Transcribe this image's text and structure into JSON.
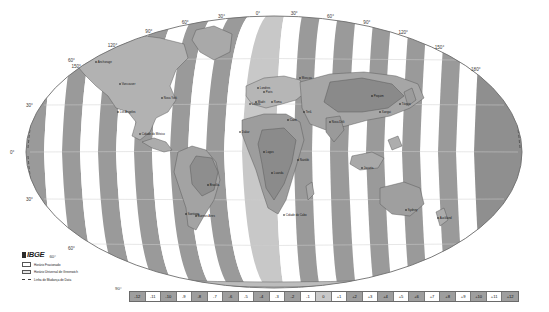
{
  "map": {
    "title": "Fusos Horários",
    "projection": "oval / Mollweide-like world projection",
    "source_org": "IBGE",
    "longitude_labels": [
      "150°",
      "120°",
      "90°",
      "60°",
      "30°",
      "0°",
      "30°",
      "60°",
      "90°",
      "120°",
      "150°",
      "180°"
    ],
    "latitude_labels_left": [
      "60°",
      "30°",
      "0°",
      "30°",
      "60°"
    ],
    "latitude_label_bottom": "90°",
    "band_colors": {
      "dark": "#9a9a9a",
      "light": "#ffffff",
      "mid": "#c8c8c8",
      "ocean": "#ffffff",
      "land_fill": "#b4b4b4",
      "land_dark": "#8d8d8d",
      "graticule": "#cfcfcf",
      "outline": "#4a4a4a"
    },
    "cities": [
      {
        "name": "Anchorage",
        "x": 96,
        "y": 62
      },
      {
        "name": "Vancouver",
        "x": 120,
        "y": 84
      },
      {
        "name": "Los Angeles",
        "x": 118,
        "y": 112
      },
      {
        "name": "Cidade do México",
        "x": 140,
        "y": 134
      },
      {
        "name": "Nova York",
        "x": 162,
        "y": 98
      },
      {
        "name": "Brasília",
        "x": 208,
        "y": 185
      },
      {
        "name": "Buenos Aires",
        "x": 196,
        "y": 216
      },
      {
        "name": "Santiago",
        "x": 186,
        "y": 214
      },
      {
        "name": "Lisboa",
        "x": 250,
        "y": 104
      },
      {
        "name": "Londres",
        "x": 258,
        "y": 88
      },
      {
        "name": "Paris",
        "x": 264,
        "y": 92
      },
      {
        "name": "Madri",
        "x": 256,
        "y": 102
      },
      {
        "name": "Roma",
        "x": 272,
        "y": 102
      },
      {
        "name": "Dakar",
        "x": 240,
        "y": 132
      },
      {
        "name": "Lagos",
        "x": 264,
        "y": 152
      },
      {
        "name": "Luanda",
        "x": 272,
        "y": 173
      },
      {
        "name": "Cidade do Cabo",
        "x": 284,
        "y": 215
      },
      {
        "name": "Cairo",
        "x": 288,
        "y": 120
      },
      {
        "name": "Nairóbi",
        "x": 298,
        "y": 160
      },
      {
        "name": "Moscou",
        "x": 300,
        "y": 78
      },
      {
        "name": "Terã",
        "x": 304,
        "y": 112
      },
      {
        "name": "Nova Déli",
        "x": 330,
        "y": 122
      },
      {
        "name": "Pequim",
        "x": 372,
        "y": 96
      },
      {
        "name": "Tóquio",
        "x": 400,
        "y": 104
      },
      {
        "name": "Xangai",
        "x": 380,
        "y": 112
      },
      {
        "name": "Jacarta",
        "x": 362,
        "y": 168
      },
      {
        "name": "Sydney",
        "x": 406,
        "y": 210
      },
      {
        "name": "Auckland",
        "x": 438,
        "y": 218
      }
    ]
  },
  "legend": {
    "org_name": "IBGE",
    "latitude_marker": "60°",
    "items": [
      {
        "swatch": "white-box",
        "label": "Horário Fracionado"
      },
      {
        "swatch": "gray-box",
        "label": "Horário Universal de Greenwich"
      },
      {
        "swatch": "dashed-line",
        "label": "Linha de Mudança de Data"
      }
    ]
  },
  "zone_scale": {
    "label_bottom_left": "90°",
    "cells": [
      {
        "label": "-12",
        "shade": "dark"
      },
      {
        "label": "-11",
        "shade": "light"
      },
      {
        "label": "-10",
        "shade": "dark"
      },
      {
        "label": "-9",
        "shade": "light"
      },
      {
        "label": "-8",
        "shade": "dark"
      },
      {
        "label": "-7",
        "shade": "light"
      },
      {
        "label": "-6",
        "shade": "dark"
      },
      {
        "label": "-5",
        "shade": "light"
      },
      {
        "label": "-4",
        "shade": "dark"
      },
      {
        "label": "-3",
        "shade": "light"
      },
      {
        "label": "-2",
        "shade": "dark"
      },
      {
        "label": "-1",
        "shade": "light"
      },
      {
        "label": "0",
        "shade": "mid"
      },
      {
        "label": "+1",
        "shade": "light"
      },
      {
        "label": "+2",
        "shade": "dark"
      },
      {
        "label": "+3",
        "shade": "light"
      },
      {
        "label": "+4",
        "shade": "dark"
      },
      {
        "label": "+5",
        "shade": "light"
      },
      {
        "label": "+6",
        "shade": "dark"
      },
      {
        "label": "+7",
        "shade": "light"
      },
      {
        "label": "+8",
        "shade": "dark"
      },
      {
        "label": "+9",
        "shade": "light"
      },
      {
        "label": "+10",
        "shade": "dark"
      },
      {
        "label": "+11",
        "shade": "light"
      },
      {
        "label": "+12",
        "shade": "dark"
      }
    ]
  }
}
